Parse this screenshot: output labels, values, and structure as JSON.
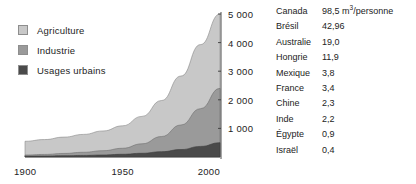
{
  "chart_data": {
    "type": "area",
    "title": "",
    "xlabel": "",
    "ylabel": "",
    "stacked": true,
    "grid": false,
    "legend_position": "top-left",
    "x": [
      1900,
      1910,
      1920,
      1930,
      1940,
      1950,
      1960,
      1970,
      1980,
      1990,
      2000
    ],
    "xlim": [
      1900,
      2000
    ],
    "ylim": [
      0,
      5000
    ],
    "xticks": [
      1900,
      1950,
      2000
    ],
    "xtick_labels": [
      "1900",
      "1950",
      "2000"
    ],
    "yticks": [
      1000,
      2000,
      3000,
      4000,
      5000
    ],
    "ytick_labels": [
      "1 000",
      "2 000",
      "3 000",
      "4 000",
      "5 000"
    ],
    "series": [
      {
        "name": "Usages urbains",
        "color": "#4a4a4a",
        "values": [
          30,
          35,
          45,
          55,
          70,
          95,
          130,
          185,
          260,
          370,
          500
        ]
      },
      {
        "name": "Industrie",
        "color": "#9a9a9a",
        "values": [
          40,
          55,
          80,
          110,
          150,
          210,
          330,
          530,
          860,
          1320,
          1900
        ]
      },
      {
        "name": "Agriculture",
        "color": "#c8c8c8",
        "values": [
          480,
          520,
          570,
          625,
          690,
          785,
          960,
          1260,
          1710,
          2240,
          2600
        ]
      }
    ],
    "totals": [
      550,
      610,
      695,
      790,
      910,
      1090,
      1420,
      1975,
      2830,
      3930,
      5000
    ]
  },
  "legend": {
    "items": [
      {
        "label": "Agriculture",
        "color": "#c8c8c8"
      },
      {
        "label": "Industrie",
        "color": "#9a9a9a"
      },
      {
        "label": "Usages urbains",
        "color": "#4a4a4a"
      }
    ]
  },
  "table": {
    "unit": "m",
    "unit_exponent": "3",
    "unit_suffix": "/personne",
    "rows": [
      {
        "country": "Canada",
        "value": "98,5",
        "unit_shown": true
      },
      {
        "country": "Brésil",
        "value": "42,96",
        "unit_shown": false
      },
      {
        "country": "Australie",
        "value": "19,0",
        "unit_shown": false
      },
      {
        "country": "Hongrie",
        "value": "11,9",
        "unit_shown": false
      },
      {
        "country": "Mexique",
        "value": "3,8",
        "unit_shown": false
      },
      {
        "country": "France",
        "value": "3,4",
        "unit_shown": false
      },
      {
        "country": "Chine",
        "value": "2,3",
        "unit_shown": false
      },
      {
        "country": "Inde",
        "value": "2,2",
        "unit_shown": false
      },
      {
        "country": "Égypte",
        "value": "0,9",
        "unit_shown": false
      },
      {
        "country": "Israël",
        "value": "0,4",
        "unit_shown": false
      }
    ]
  },
  "colors": {
    "agriculture": "#c8c8c8",
    "industrie": "#9a9a9a",
    "urbain": "#4a4a4a",
    "axis": "#3a3a3a",
    "text": "#232323"
  }
}
